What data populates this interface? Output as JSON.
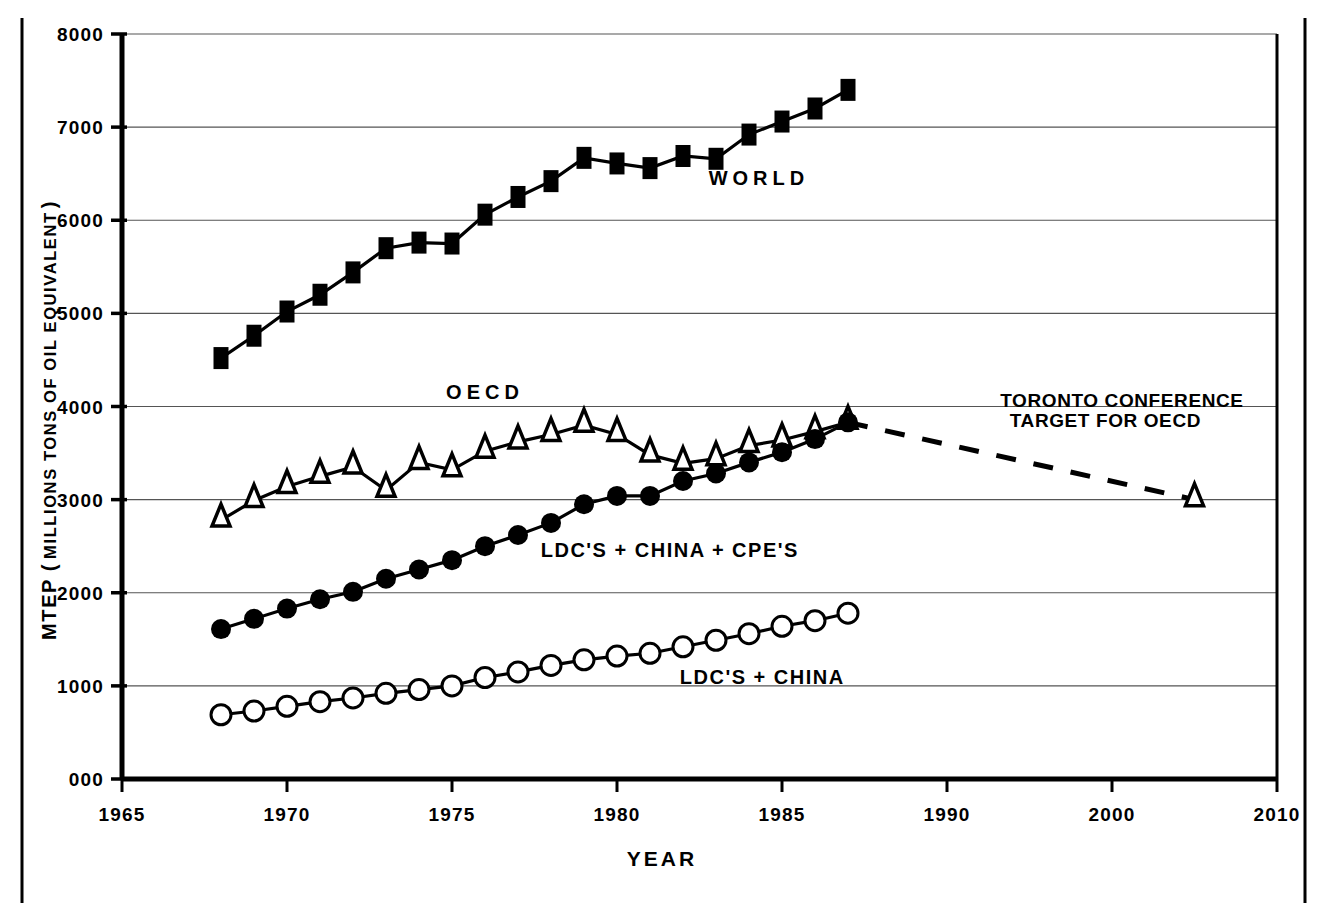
{
  "chart_data": {
    "type": "line",
    "title": "",
    "xlabel": "YEAR",
    "ylabel": "MTEP ( MILLIONS TONS OF OIL EQUIVALENT )",
    "ylabel_parts": {
      "prefix": "MTEP (",
      "inner": "MILLIONS TONS OF OIL  EQUIVALENT",
      "suffix": ")"
    },
    "grid": true,
    "legend_position": "inline-annotations",
    "x_axis": {
      "tick_labels": [
        "1965",
        "1970",
        "1975",
        "1980",
        "1985",
        "1990",
        "2000",
        "2010"
      ],
      "tick_values": [
        1965,
        1970,
        1975,
        1980,
        1985,
        1990,
        2000,
        2010
      ],
      "note": "ticks evenly spaced; scale compresses after 1990"
    },
    "y_axis": {
      "tick_labels": [
        "000",
        "1000",
        "2000",
        "3000",
        "4000",
        "5000",
        "6000",
        "7000",
        "8000"
      ],
      "tick_values": [
        0,
        1000,
        2000,
        3000,
        4000,
        5000,
        6000,
        7000,
        8000
      ],
      "ylim": [
        0,
        8000
      ]
    },
    "series": [
      {
        "name": "WORLD",
        "label": "WORLD",
        "marker": "filled-square",
        "linestyle": "solid",
        "color": "#000000",
        "x": [
          1968,
          1969,
          1970,
          1971,
          1972,
          1973,
          1974,
          1975,
          1976,
          1977,
          1978,
          1979,
          1980,
          1981,
          1982,
          1983,
          1984,
          1985,
          1986,
          1987
        ],
        "values": [
          4520,
          4760,
          5020,
          5200,
          5440,
          5700,
          5760,
          5750,
          6060,
          6250,
          6420,
          6670,
          6610,
          6560,
          6690,
          6660,
          6920,
          7060,
          7200,
          7400
        ]
      },
      {
        "name": "OECD",
        "label": "OECD",
        "marker": "hollow-triangle",
        "linestyle": "solid",
        "color": "#000000",
        "x": [
          1968,
          1969,
          1970,
          1971,
          1972,
          1973,
          1974,
          1975,
          1976,
          1977,
          1978,
          1979,
          1980,
          1981,
          1982,
          1983,
          1984,
          1985,
          1986,
          1987
        ],
        "values": [
          2780,
          2990,
          3140,
          3250,
          3350,
          3100,
          3400,
          3320,
          3520,
          3620,
          3700,
          3800,
          3700,
          3480,
          3390,
          3440,
          3580,
          3640,
          3730,
          3830
        ]
      },
      {
        "name": "LDC'S + CHINA + CPE'S",
        "label": "LDC'S + CHINA + CPE'S",
        "marker": "filled-circle",
        "linestyle": "solid",
        "color": "#000000",
        "x": [
          1968,
          1969,
          1970,
          1971,
          1972,
          1973,
          1974,
          1975,
          1976,
          1977,
          1978,
          1979,
          1980,
          1981,
          1982,
          1983,
          1984,
          1985,
          1986,
          1987
        ],
        "values": [
          1610,
          1720,
          1830,
          1930,
          2010,
          2150,
          2250,
          2350,
          2500,
          2620,
          2750,
          2950,
          3040,
          3040,
          3200,
          3280,
          3400,
          3510,
          3650,
          3830
        ]
      },
      {
        "name": "LDC'S + CHINA",
        "label": "LDC'S + CHINA",
        "marker": "hollow-circle",
        "linestyle": "solid",
        "color": "#000000",
        "x": [
          1968,
          1969,
          1970,
          1971,
          1972,
          1973,
          1974,
          1975,
          1976,
          1977,
          1978,
          1979,
          1980,
          1981,
          1982,
          1983,
          1984,
          1985,
          1986,
          1987
        ],
        "values": [
          690,
          730,
          780,
          830,
          870,
          920,
          960,
          1000,
          1090,
          1150,
          1220,
          1280,
          1320,
          1350,
          1420,
          1490,
          1560,
          1640,
          1700,
          1780
        ]
      },
      {
        "name": "TORONTO CONFERENCE TARGET FOR OECD",
        "label": "TORONTO CONFERENCE TARGET FOR OECD",
        "marker": "hollow-triangle",
        "linestyle": "dashed",
        "color": "#000000",
        "x": [
          1987,
          2005
        ],
        "values": [
          3830,
          3000
        ]
      }
    ],
    "annotations": [
      {
        "id": "world",
        "text": "WORLD",
        "x": 1984.3,
        "y": 6380
      },
      {
        "id": "oecd",
        "text": "OECD",
        "x": 1976.0,
        "y": 4080
      },
      {
        "id": "ldc-china-cpe",
        "text": "LDC'S + CHINA + CPE'S",
        "x": 1981.6,
        "y": 2380
      },
      {
        "id": "ldc-china",
        "text": "LDC'S + CHINA",
        "x": 1984.4,
        "y": 1020
      },
      {
        "id": "toronto-line1",
        "text": "TORONTO CONFERENCE",
        "x": 2000.6,
        "y": 4000
      },
      {
        "id": "toronto-line2",
        "text": "TARGET FOR OECD",
        "x": 1999.6,
        "y": 3780
      }
    ]
  }
}
